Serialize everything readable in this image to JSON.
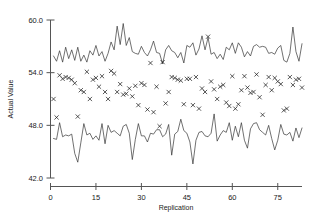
{
  "chart_data": {
    "type": "scatter",
    "title": "",
    "xlabel": "Replication",
    "ylabel": "Actual Value",
    "xlim": [
      0,
      83
    ],
    "ylim": [
      42.0,
      60.0
    ],
    "grid": false,
    "legend": "none",
    "xticks": [
      0,
      15,
      30,
      45,
      60,
      75
    ],
    "xtick_labels": [
      "0",
      "15",
      "30",
      "45",
      "60",
      "75"
    ],
    "yticks": [
      42.0,
      48.0,
      54.0,
      60.0
    ],
    "ytick_labels": [
      "42.0",
      "48.0",
      "54.0",
      "60.0"
    ],
    "series": [
      {
        "name": "Upper Limit",
        "render": "line",
        "x": [
          1,
          2,
          3,
          4,
          5,
          6,
          7,
          8,
          9,
          10,
          11,
          12,
          13,
          14,
          15,
          16,
          17,
          18,
          19,
          20,
          21,
          22,
          23,
          24,
          25,
          26,
          27,
          28,
          29,
          30,
          31,
          32,
          33,
          34,
          35,
          36,
          37,
          38,
          39,
          40,
          41,
          42,
          43,
          44,
          45,
          46,
          47,
          48,
          49,
          50,
          51,
          52,
          53,
          54,
          55,
          56,
          57,
          58,
          59,
          60,
          61,
          62,
          63,
          64,
          65,
          66,
          67,
          68,
          69,
          70,
          71,
          72,
          73,
          74,
          75,
          76,
          77,
          78,
          79,
          80,
          81,
          82,
          83
        ],
        "values": [
          55.9,
          55.3,
          56.5,
          55.2,
          56.9,
          55.6,
          56.6,
          55.4,
          56.9,
          55.3,
          56.0,
          55.2,
          56.5,
          56.0,
          57.1,
          55.9,
          56.4,
          55.3,
          56.2,
          57.5,
          56.6,
          59.3,
          57.2,
          59.6,
          57.1,
          58.0,
          56.4,
          56.2,
          56.1,
          57.0,
          56.3,
          55.9,
          56.6,
          57.6,
          56.3,
          56.2,
          55.0,
          56.6,
          57.1,
          56.5,
          56.3,
          55.7,
          56.3,
          55.1,
          57.1,
          56.9,
          57.4,
          56.0,
          56.7,
          58.2,
          56.6,
          58.0,
          56.1,
          56.3,
          55.6,
          56.1,
          55.5,
          56.9,
          56.6,
          57.4,
          56.2,
          57.4,
          56.9,
          55.8,
          56.4,
          55.9,
          57.0,
          57.2,
          56.9,
          57.0,
          56.9,
          56.2,
          56.3,
          56.1,
          56.8,
          57.1,
          55.4,
          55.2,
          56.2,
          59.2,
          56.4,
          55.3,
          57.3
        ]
      },
      {
        "name": "Lower Limit",
        "render": "line",
        "x": [
          1,
          2,
          3,
          4,
          5,
          6,
          7,
          8,
          9,
          10,
          11,
          12,
          13,
          14,
          15,
          16,
          17,
          18,
          19,
          20,
          21,
          22,
          23,
          24,
          25,
          26,
          27,
          28,
          29,
          30,
          31,
          32,
          33,
          34,
          35,
          36,
          37,
          38,
          39,
          40,
          41,
          42,
          43,
          44,
          45,
          46,
          47,
          48,
          49,
          50,
          51,
          52,
          53,
          54,
          55,
          56,
          57,
          58,
          59,
          60,
          61,
          62,
          63,
          64,
          65,
          66,
          67,
          68,
          69,
          70,
          71,
          72,
          73,
          74,
          75,
          76,
          77,
          78,
          79,
          80,
          81,
          82,
          83
        ],
        "values": [
          46.5,
          46.4,
          48.3,
          46.7,
          46.9,
          46.8,
          47.0,
          44.8,
          43.8,
          46.0,
          48.2,
          46.9,
          47.1,
          46.4,
          46.8,
          46.3,
          48.2,
          45.9,
          48.0,
          47.2,
          47.4,
          47.1,
          46.8,
          47.9,
          48.1,
          47.1,
          44.1,
          46.4,
          48.2,
          46.8,
          46.8,
          46.1,
          47.1,
          47.0,
          47.5,
          47.5,
          46.7,
          47.0,
          48.1,
          44.6,
          47.0,
          47.3,
          48.7,
          47.4,
          47.1,
          46.1,
          43.6,
          46.3,
          47.2,
          47.3,
          46.8,
          46.7,
          47.1,
          49.3,
          46.2,
          46.9,
          47.4,
          47.2,
          48.3,
          46.3,
          47.9,
          46.7,
          48.3,
          46.3,
          45.4,
          47.6,
          48.2,
          48.3,
          47.5,
          47.2,
          46.9,
          48.0,
          46.5,
          45.2,
          46.3,
          48.1,
          47.0,
          46.9,
          47.2,
          46.2,
          47.7,
          46.6,
          47.7
        ]
      },
      {
        "name": "Actual Value",
        "render": "markers",
        "marker": "x",
        "x": [
          1,
          2,
          3,
          4,
          5,
          6,
          7,
          8,
          9,
          10,
          11,
          12,
          13,
          14,
          15,
          16,
          17,
          18,
          19,
          20,
          21,
          22,
          23,
          24,
          25,
          26,
          27,
          28,
          29,
          30,
          31,
          32,
          33,
          34,
          35,
          36,
          37,
          38,
          39,
          40,
          41,
          42,
          43,
          44,
          45,
          46,
          47,
          48,
          49,
          50,
          51,
          52,
          53,
          54,
          55,
          56,
          57,
          58,
          59,
          60,
          61,
          62,
          63,
          64,
          65,
          66,
          67,
          68,
          69,
          70,
          71,
          72,
          73,
          74,
          75,
          76,
          77,
          78,
          79,
          80,
          81,
          82,
          83
        ],
        "values": [
          51.0,
          48.9,
          53.7,
          53.3,
          53.5,
          53.4,
          53.2,
          52.8,
          49.0,
          52.0,
          51.8,
          54.1,
          51.0,
          53.2,
          53.4,
          52.4,
          53.6,
          51.8,
          51.0,
          54.2,
          53.9,
          51.8,
          52.7,
          51.5,
          51.6,
          52.2,
          51.3,
          52.5,
          50.3,
          52.8,
          52.6,
          49.8,
          55.1,
          49.5,
          52.4,
          47.9,
          55.2,
          50.5,
          51.8,
          53.5,
          53.4,
          53.2,
          53.1,
          50.4,
          53.3,
          53.3,
          50.3,
          53.5,
          49.9,
          52.2,
          51.8,
          58.1,
          53.0,
          52.1,
          51.0,
          52.4,
          52.6,
          50.6,
          50.2,
          53.6,
          49.9,
          50.4,
          52.0,
          53.6,
          52.3,
          51.7,
          51.8,
          53.8,
          51.2,
          49.2,
          52.6,
          53.5,
          52.0,
          53.4,
          53.0,
          52.7,
          49.7,
          49.9,
          53.5,
          52.6,
          53.2,
          53.3,
          52.3
        ]
      }
    ]
  }
}
